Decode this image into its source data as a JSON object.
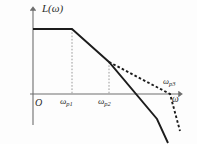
{
  "figure": {
    "background_color": "#fdfdfd",
    "line_color": "#1c1c1c",
    "axis_color": "#6e6e6e",
    "guide_color": "#9a9a9a"
  },
  "labels": {
    "y_axis": "L(ω)",
    "x_axis": "ω",
    "origin": "O",
    "omega_p1_main": "ω",
    "omega_p1_sub": "p1",
    "omega_p2_main": "ω",
    "omega_p2_sub": "p2",
    "omega_p3_main": "ω",
    "omega_p3_sub": "p3"
  },
  "chart_data": {
    "type": "line",
    "title": "L(ω)",
    "xlabel": "ω",
    "ylabel": "L(ω)",
    "grid": false,
    "legend": false,
    "axis_origin_label": "O",
    "xticks": [
      "ωp1",
      "ωp2",
      "ωp3"
    ],
    "xtick_positions_px": [
      72,
      109,
      170
    ],
    "annotations": [
      "ωp3"
    ],
    "series": [
      {
        "name": "solid-asymptote",
        "style": "solid",
        "points_px": [
          [
            33,
            29
          ],
          [
            72,
            29
          ],
          [
            109,
            62
          ],
          [
            157,
            119
          ],
          [
            168,
            143
          ]
        ],
        "description": "0 dB/dec flat until ωp1, then -20 dB/dec, steepening after ωp2, final steep roll-off"
      },
      {
        "name": "dashed-asymptote",
        "style": "dashed",
        "points_px": [
          [
            109,
            62
          ],
          [
            170,
            94
          ],
          [
            180,
            131
          ]
        ],
        "description": "alternative branch with shallower slope crossing the ω axis at ωp3 then dropping steeply"
      }
    ],
    "guide_lines": [
      {
        "name": "ωp1-dropline",
        "x_px": 72,
        "y_top_px": 29,
        "y_bottom_px": 94,
        "style": "dashed"
      },
      {
        "name": "ωp2-dropline",
        "x_px": 109,
        "y_top_px": 62,
        "y_bottom_px": 94,
        "style": "dashed"
      }
    ],
    "axes_px": {
      "x_axis_y": 94,
      "x_axis_from": 30,
      "x_axis_to": 181,
      "y_axis_x": 33,
      "y_axis_from": 125,
      "y_axis_to": 8
    }
  }
}
